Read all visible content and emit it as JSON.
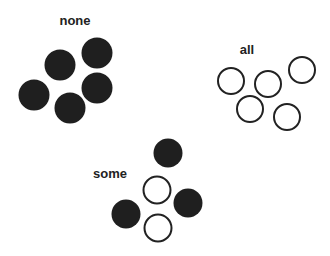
{
  "groups": [
    {
      "label": "none",
      "label_pos": [
        75,
        20
      ],
      "diameter": 31,
      "circles": [
        {
          "x": 60,
          "y": 65,
          "filled": true
        },
        {
          "x": 97,
          "y": 53,
          "filled": true
        },
        {
          "x": 34,
          "y": 95,
          "filled": true
        },
        {
          "x": 97,
          "y": 88,
          "filled": true
        },
        {
          "x": 70,
          "y": 108,
          "filled": true
        }
      ]
    },
    {
      "label": "all",
      "label_pos": [
        247,
        49
      ],
      "diameter": 28,
      "circles": [
        {
          "x": 231,
          "y": 81,
          "filled": false
        },
        {
          "x": 268,
          "y": 84,
          "filled": false
        },
        {
          "x": 302,
          "y": 70,
          "filled": false
        },
        {
          "x": 250,
          "y": 109,
          "filled": false
        },
        {
          "x": 287,
          "y": 117,
          "filled": false
        }
      ]
    },
    {
      "label": "some",
      "label_pos": [
        110,
        173
      ],
      "diameter": 29,
      "circles": [
        {
          "x": 168,
          "y": 153,
          "filled": true
        },
        {
          "x": 157,
          "y": 190,
          "filled": false
        },
        {
          "x": 188,
          "y": 203,
          "filled": true
        },
        {
          "x": 126,
          "y": 214,
          "filled": true
        },
        {
          "x": 158,
          "y": 228,
          "filled": false
        }
      ]
    }
  ]
}
